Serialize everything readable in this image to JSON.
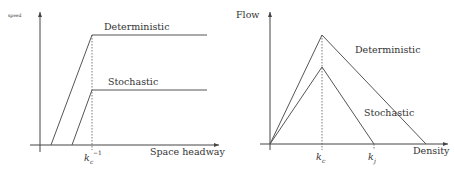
{
  "left_panel": {
    "y_axis_label": "speed",
    "x_axis_label": "Space headway",
    "x_tick_base": "k",
    "x_tick_sub": "c",
    "x_tick_sup": "−1",
    "series": [
      {
        "name": "Deterministic",
        "label": "Deterministic"
      },
      {
        "name": "Stochastic",
        "label": "Stochastic"
      }
    ]
  },
  "right_panel": {
    "y_axis_label": "Flow",
    "x_axis_label": "Density",
    "ticks": [
      {
        "base": "k",
        "sub": "c"
      },
      {
        "base": "k",
        "sub": "j"
      }
    ],
    "series": [
      {
        "name": "Deterministic",
        "label": "Deterministic"
      },
      {
        "name": "Stochastic",
        "label": "Stochastic"
      }
    ]
  },
  "colors": {
    "line": "#555555",
    "axis": "#444444",
    "text": "#333333"
  }
}
